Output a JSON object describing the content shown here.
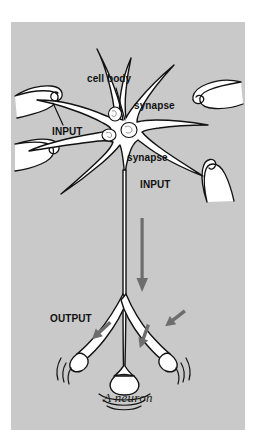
{
  "figure": {
    "title": "A neuron",
    "caption": "A neuron",
    "background_color": "#ffffff",
    "panel_color": "#c9c9c9",
    "outline_color": "#121212",
    "cell_fill_color": "#ffffff",
    "arrow_color": "#6d6d6d",
    "label_color": "#111111"
  },
  "labels": {
    "cell_body": "cell body",
    "synapse_upper": "synapse",
    "synapse_lower": "synapse",
    "input_left": "INPUT",
    "input_right": "INPUT",
    "output": "OUTPUT"
  },
  "diagram_parts": {
    "soma": "cell-body",
    "organelles": [
      "nucleus",
      "organelle",
      "organelle"
    ],
    "dendrites_count": 8,
    "incoming_axon_terminals": 4,
    "axon": "axon",
    "axon_direction_arrow": "down",
    "terminal_branches": 3,
    "signal_arcs_per_terminal": 3,
    "output_arrows": 3
  },
  "icons": {
    "axon_flow": "down-arrow-icon",
    "output_flow": "diagonal-arrow-icon",
    "leader_line": "leader-line-icon"
  }
}
